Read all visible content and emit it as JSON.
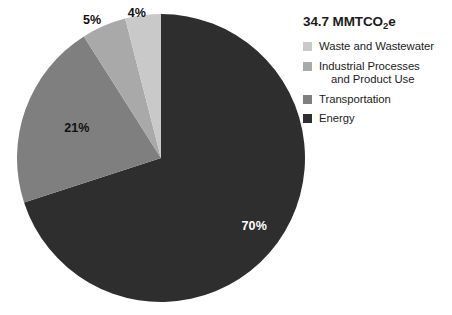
{
  "chart_data": {
    "type": "pie",
    "title": "34.7 MMTCO2e",
    "title_prefix": "34.7 MMTCO",
    "title_subscript": "2",
    "title_suffix": "e",
    "total_value": 34.7,
    "units": "MMTCO2e",
    "xlabel": "",
    "ylabel": "",
    "legend_position": "right",
    "grid": false,
    "categories": [
      "Waste and Wastewater",
      "Industrial Processes and Product Use",
      "Transportation",
      "Energy"
    ],
    "values": [
      4,
      5,
      21,
      70
    ],
    "value_labels": [
      "4%",
      "5%",
      "21%",
      "70%"
    ],
    "colors": [
      "#c9c9c9",
      "#a9a9a9",
      "#7f7f7f",
      "#2e2e2e"
    ],
    "slices": [
      {
        "name": "Energy",
        "percent": 70,
        "label": "70%",
        "color": "#2e2e2e",
        "label_color": "#ffffff",
        "start_angle": 0,
        "end_angle": 252
      },
      {
        "name": "Transportation",
        "percent": 21,
        "label": "21%",
        "color": "#7f7f7f",
        "label_color": "#111111",
        "start_angle": 252,
        "end_angle": 327.6
      },
      {
        "name": "Industrial Processes and Product Use",
        "percent": 5,
        "label": "5%",
        "color": "#a9a9a9",
        "label_color": "#111111",
        "start_angle": 327.6,
        "end_angle": 345.6
      },
      {
        "name": "Waste and Wastewater",
        "percent": 4,
        "label": "4%",
        "color": "#c9c9c9",
        "label_color": "#111111",
        "start_angle": 345.6,
        "end_angle": 360
      }
    ]
  },
  "legend": {
    "items": [
      {
        "label": "Waste and Wastewater",
        "line1": "Waste and Wastewater",
        "line2": "",
        "color": "#c9c9c9"
      },
      {
        "label": "Industrial Processes and Product Use",
        "line1": "Industrial Processes",
        "line2": "and Product Use",
        "color": "#a9a9a9"
      },
      {
        "label": "Transportation",
        "line1": "Transportation",
        "line2": "",
        "color": "#7f7f7f"
      },
      {
        "label": "Energy",
        "line1": "Energy",
        "line2": "",
        "color": "#2e2e2e"
      }
    ]
  },
  "geometry": {
    "center_x": 161,
    "center_y": 158,
    "radius": 144
  }
}
